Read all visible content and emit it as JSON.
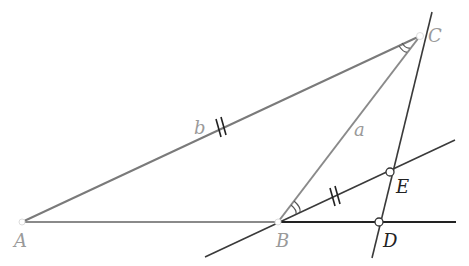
{
  "figure": {
    "type": "geometry-triangle-construction",
    "points": {
      "A": {
        "label": "A",
        "x": 22,
        "y": 222
      },
      "B": {
        "label": "B",
        "x": 278,
        "y": 222
      },
      "C": {
        "label": "C",
        "x": 420,
        "y": 36
      },
      "D": {
        "label": "D",
        "x": 379,
        "y": 222
      },
      "E": {
        "label": "E",
        "x": 390,
        "y": 172
      }
    },
    "side_labels": {
      "a": "a",
      "b": "b"
    },
    "colors": {
      "triangle": "#8a8a8a",
      "construction": "#3a3a3a",
      "label_gray": "#9a9a9a",
      "label_dark": "#222222",
      "point_fill": "#ffffff"
    }
  }
}
